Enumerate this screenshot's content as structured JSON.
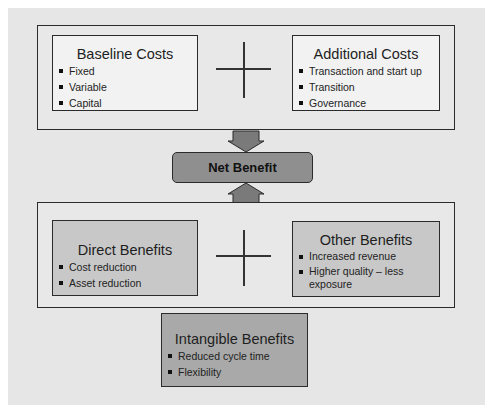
{
  "diagram": {
    "top_panel": {
      "left_box": {
        "title": "Baseline Costs",
        "items": [
          "Fixed",
          "Variable",
          "Capital"
        ]
      },
      "operator": "plus",
      "right_box": {
        "title": "Additional Costs",
        "items": [
          "Transaction and start up",
          "Transition",
          "Governance"
        ]
      }
    },
    "center": {
      "label": "Net Benefit",
      "arrows": [
        "down-from-costs",
        "up-from-benefits"
      ]
    },
    "bottom_panel": {
      "left_box": {
        "title": "Direct Benefits",
        "items": [
          "Cost reduction",
          "Asset reduction"
        ]
      },
      "operator": "plus",
      "right_box": {
        "title": "Other Benefits",
        "items": [
          "Increased revenue",
          "Higher quality – less exposure"
        ]
      }
    },
    "extra_box": {
      "title": "Intangible Benefits",
      "items": [
        "Reduced cycle time",
        "Flexibility"
      ]
    },
    "colors": {
      "background": "#e6e6e6",
      "cost_box": "#f2f2f2",
      "benefit_box": "#c8c8c8",
      "intangible_box": "#a9a9a9",
      "net_benefit": "#8f8f8f",
      "arrow": "#7a7a7a",
      "border": "#2b2b2b"
    }
  }
}
